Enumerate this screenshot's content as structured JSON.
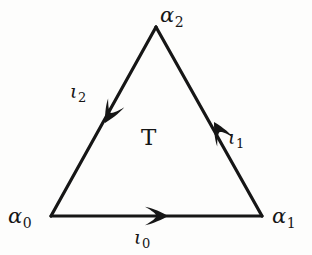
{
  "figure": {
    "type": "directed-simplex-diagram",
    "background_color": "#fdfdfc",
    "ink_color": "#161616",
    "interior_label": "T"
  },
  "vertices": [
    {
      "id": "a0",
      "base": "α",
      "subscript": "0",
      "text": "α0",
      "position": "bottom-left",
      "x": 51,
      "y": 216
    },
    {
      "id": "a1",
      "base": "α",
      "subscript": "1",
      "text": "α1",
      "position": "bottom-right",
      "x": 262,
      "y": 216
    },
    {
      "id": "a2",
      "base": "α",
      "subscript": "2",
      "text": "α2",
      "position": "apex",
      "x": 156,
      "y": 27
    }
  ],
  "edges": [
    {
      "id": "i0",
      "base": "ι",
      "subscript": "0",
      "text": "ι0",
      "from": "a0",
      "to": "a1",
      "side": "bottom",
      "arrow_direction": "right",
      "label_side": "below"
    },
    {
      "id": "i1",
      "base": "ι",
      "subscript": "1",
      "text": "ι1",
      "from": "a1",
      "to": "a2",
      "side": "right",
      "arrow_direction": "up-left",
      "label_side": "outside-right"
    },
    {
      "id": "i2",
      "base": "ι",
      "subscript": "2",
      "text": "ι2",
      "from": "a2",
      "to": "a0",
      "side": "left",
      "arrow_direction": "down-left",
      "label_side": "outside-left"
    }
  ]
}
